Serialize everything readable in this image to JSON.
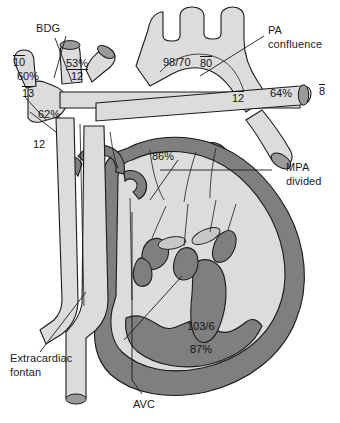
{
  "figure": {
    "colors": {
      "lumen_fill": "#dcdcdc",
      "myocardium_fill": "#7f7f7f",
      "vessel_lumen_cap": "#9a9a9a",
      "outline": "#1a1a1a",
      "background": "#ffffff",
      "text": "#141414"
    }
  },
  "labels": {
    "bdg": "BDG",
    "pa_confluence_line1": "PA",
    "pa_confluence_line2": "confluence",
    "mpa_divided_line1": "MPA",
    "mpa_divided_line2": "divided",
    "extracardiac_line1": "Extracardiac",
    "extracardiac_line2": "fontan",
    "avc": "AVC"
  },
  "measurements": {
    "svc_mean_upper": "10",
    "svc_saturation": "60%",
    "svc_mean_lower": "13",
    "glenn_saturation": "53%",
    "glenn_mean": "12",
    "innominate_saturation": "62%",
    "fontan_mean": "12",
    "aorta_pressure": "98/70",
    "aorta_mean": "80",
    "lpa_mean": "12",
    "rpa_saturation": "64%",
    "rpa_mean": "8",
    "atrial_saturation": "86%",
    "ventricle_pressure": "103/6",
    "ventricle_saturation": "87%"
  }
}
